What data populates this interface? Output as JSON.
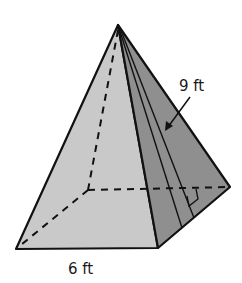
{
  "figure": {
    "type": "square-pyramid",
    "labels": {
      "slant_height": "9 ft",
      "base_edge": "6 ft"
    },
    "colors": {
      "front_face": "#c9c9c9",
      "right_face": "#8f8f8f",
      "edge": "#111111",
      "background": "#ffffff"
    }
  }
}
